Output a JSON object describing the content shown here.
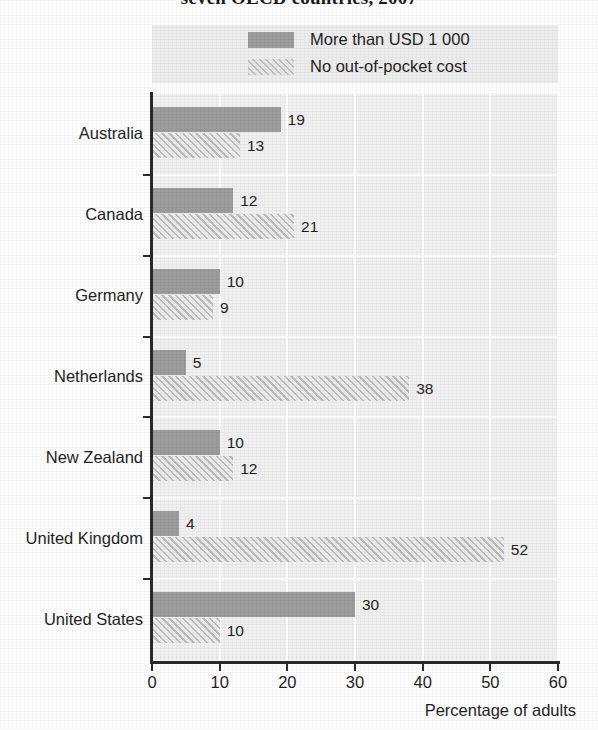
{
  "chart_data": {
    "type": "bar",
    "orientation": "horizontal",
    "title": "seven OECD countries, 2007",
    "xlabel": "Percentage of adults",
    "ylabel": "",
    "xlim": [
      0,
      60
    ],
    "xticks": [
      0,
      10,
      20,
      30,
      40,
      50,
      60
    ],
    "grid": true,
    "legend_position": "top",
    "categories": [
      "Australia",
      "Canada",
      "Germany",
      "Netherlands",
      "New Zealand",
      "United Kingdom",
      "United States"
    ],
    "series": [
      {
        "name": "More than USD 1 000",
        "style": "solid",
        "color": "#9d9d9d",
        "values": [
          19,
          12,
          10,
          5,
          10,
          4,
          30
        ]
      },
      {
        "name": "No out-of-pocket cost",
        "style": "hatched",
        "color": "#dedede",
        "values": [
          13,
          21,
          9,
          38,
          12,
          52,
          10
        ]
      }
    ]
  },
  "legend": {
    "items": [
      {
        "label": "More than USD 1 000",
        "swatch": "solid-swatch"
      },
      {
        "label": "No out-of-pocket cost",
        "swatch": "hatched-swatch"
      }
    ]
  },
  "axis": {
    "x_title": "Percentage of adults",
    "tick_labels": [
      "0",
      "10",
      "20",
      "30",
      "40",
      "50",
      "60"
    ]
  },
  "colors": {
    "series_solid": "#9d9d9d",
    "series_hatch": "#dedede",
    "plot_background": "#f1f1f1",
    "legend_background": "#eeeeee",
    "gridline": "#ffffff",
    "axis": "#2a2a2a",
    "text": "#1f1f1f"
  }
}
